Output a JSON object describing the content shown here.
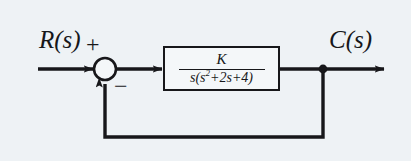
{
  "diagram": {
    "type": "control-system-block-diagram",
    "background_color": "#eef2f5",
    "line_color": "#17171a",
    "block_fill_color": "#f4f7f9",
    "input_label": "R(s)",
    "output_label": "C(s)",
    "summing_junction": {
      "positive_sign": "+",
      "negative_sign": "−",
      "input_port_sign": "+",
      "feedback_port_sign": "−"
    },
    "transfer_function_block": {
      "numerator": "K",
      "denominator_prefix": "s(s",
      "denominator_exponent": "2",
      "denominator_suffix": "+2s+4)",
      "denominator_full": "s(s^2+2s+4)",
      "expression": "K / (s(s^2+2s+4))"
    },
    "feedback_path": {
      "gain": "1",
      "description": "unity feedback"
    },
    "nodes": {
      "takeoff_point_label": "output takeoff node"
    }
  }
}
